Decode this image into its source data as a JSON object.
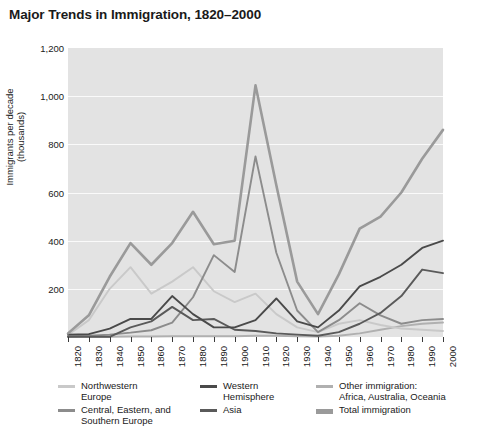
{
  "title": "Major Trends in Immigration, 1820–2000",
  "yaxis": {
    "label": "Immigrants per decade\n(thousands)",
    "ticks": [
      "1,200",
      "1,000",
      "800",
      "600",
      "400",
      "200"
    ],
    "min": 0,
    "max": 1200
  },
  "xaxis": {
    "label": "",
    "ticks": [
      "1820",
      "1830",
      "1840",
      "1850",
      "1860",
      "1870",
      "1880",
      "1890",
      "1900",
      "1910",
      "1920",
      "1930",
      "1940",
      "1950",
      "1960",
      "1970",
      "1980",
      "1990",
      "2000"
    ]
  },
  "legend": [
    {
      "label": "Northwestern\nEurope",
      "color": "#c9c9c9",
      "width": 3
    },
    {
      "label": "Central, Eastern, and\nSouthern Europe",
      "color": "#8c8c8c",
      "width": 3
    },
    {
      "label": "Western\nHemisphere",
      "color": "#4a4a4a",
      "width": 3
    },
    {
      "label": "Asia",
      "color": "#5a5a5a",
      "width": 3
    },
    {
      "label": "Other immigration:\nAfrica, Australia, Oceania",
      "color": "#b0b0b0",
      "width": 3
    },
    {
      "label": "Total immigration",
      "color": "#9a9a9a",
      "width": 5
    }
  ],
  "colors": {
    "plot_background": "#e3e3e3",
    "gridline": "#fafafa",
    "axis": "#3a3a3a",
    "text": "#1a1a1a"
  },
  "chart_data": {
    "type": "line",
    "title": "Major Trends in Immigration, 1820–2000",
    "xlabel": "",
    "ylabel": "Immigrants per decade (thousands)",
    "xlim": [
      1820,
      2000
    ],
    "ylim": [
      0,
      1200
    ],
    "grid": true,
    "legend_position": "bottom",
    "x": [
      1820,
      1830,
      1840,
      1850,
      1860,
      1870,
      1880,
      1890,
      1900,
      1910,
      1920,
      1930,
      1940,
      1950,
      1960,
      1970,
      1980,
      1990,
      2000
    ],
    "series": [
      {
        "name": "Northwestern Europe",
        "color": "#c9c9c9",
        "values": [
          8,
          70,
          200,
          290,
          180,
          230,
          290,
          190,
          145,
          180,
          95,
          40,
          20,
          55,
          70,
          50,
          35,
          30,
          25
        ]
      },
      {
        "name": "Central, Eastern, and Southern Europe",
        "color": "#8c8c8c",
        "values": [
          2,
          5,
          10,
          18,
          28,
          60,
          165,
          340,
          270,
          750,
          350,
          110,
          20,
          70,
          140,
          90,
          55,
          70,
          75
        ]
      },
      {
        "name": "Western Hemisphere",
        "color": "#4a4a4a",
        "values": [
          10,
          12,
          35,
          75,
          75,
          170,
          95,
          40,
          40,
          70,
          160,
          65,
          40,
          110,
          210,
          250,
          300,
          370,
          400
        ]
      },
      {
        "name": "Asia",
        "color": "#5a5a5a",
        "values": [
          1,
          1,
          1,
          40,
          65,
          125,
          70,
          75,
          30,
          25,
          15,
          10,
          5,
          20,
          55,
          100,
          170,
          280,
          265
        ]
      },
      {
        "name": "Other immigration: Africa, Australia, Oceania",
        "color": "#b0b0b0",
        "values": [
          1,
          1,
          1,
          2,
          2,
          3,
          3,
          3,
          3,
          5,
          5,
          3,
          2,
          5,
          15,
          30,
          45,
          55,
          60
        ]
      },
      {
        "name": "Total immigration",
        "color": "#9a9a9a",
        "values": [
          15,
          90,
          250,
          390,
          300,
          390,
          520,
          385,
          400,
          1045,
          630,
          230,
          95,
          260,
          450,
          500,
          600,
          740,
          860
        ]
      }
    ]
  },
  "source_note": ""
}
